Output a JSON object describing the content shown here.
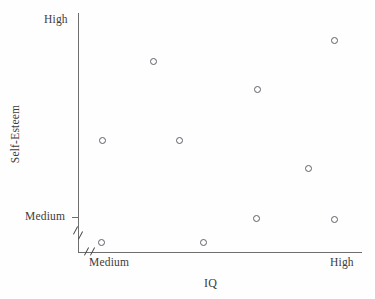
{
  "chart_data": {
    "type": "scatter",
    "title": "",
    "xlabel": "IQ",
    "ylabel": "Self-Esteem",
    "x_tick_labels": [
      "Medium",
      "High"
    ],
    "y_tick_labels": [
      "Medium",
      "High"
    ],
    "xlim": [
      "Medium",
      "High"
    ],
    "ylim": [
      "Medium",
      "High"
    ],
    "grid": false,
    "legend": null,
    "axis_break_x": true,
    "axis_break_y": true,
    "marker": "open-circle",
    "marker_color": "#5e5e66",
    "n_points": 10,
    "points": [
      {
        "id": "p1",
        "px": 101,
        "py": 242,
        "iq": "low-medium",
        "self_esteem": "below-medium"
      },
      {
        "id": "p2",
        "px": 102,
        "py": 140,
        "iq": "low-medium",
        "self_esteem": "mid-high"
      },
      {
        "id": "p3",
        "px": 153,
        "py": 61,
        "iq": "medium",
        "self_esteem": "high"
      },
      {
        "id": "p4",
        "px": 179,
        "py": 140,
        "iq": "medium",
        "self_esteem": "mid-high"
      },
      {
        "id": "p5",
        "px": 203,
        "py": 242,
        "iq": "medium-high",
        "self_esteem": "below-medium"
      },
      {
        "id": "p6",
        "px": 256,
        "py": 218,
        "iq": "medium-high",
        "self_esteem": "medium"
      },
      {
        "id": "p7",
        "px": 257,
        "py": 89,
        "iq": "medium-high",
        "self_esteem": "high"
      },
      {
        "id": "p8",
        "px": 308,
        "py": 168,
        "iq": "high",
        "self_esteem": "mid"
      },
      {
        "id": "p9",
        "px": 334,
        "py": 40,
        "iq": "high",
        "self_esteem": "very-high"
      },
      {
        "id": "p10",
        "px": 334,
        "py": 219,
        "iq": "high",
        "self_esteem": "medium"
      }
    ]
  },
  "axes": {
    "y": {
      "title": "Self-Esteem",
      "high_label": "High",
      "medium_label": "Medium"
    },
    "x": {
      "title": "IQ",
      "medium_label": "Medium",
      "high_label": "High"
    }
  },
  "colors": {
    "axis": "#6e6e6e",
    "text": "#3c3c3c",
    "marker": "#5e5e66",
    "background": "#fefefe"
  }
}
